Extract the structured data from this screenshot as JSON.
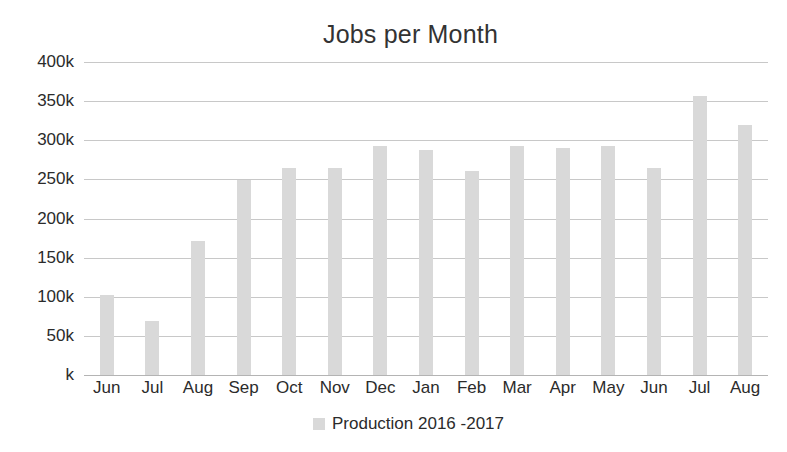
{
  "chart_data": {
    "type": "bar",
    "title": "Jobs per Month",
    "xlabel": "",
    "ylabel": "",
    "categories": [
      "Jun",
      "Jul",
      "Aug",
      "Sep",
      "Oct",
      "Nov",
      "Dec",
      "Jan",
      "Feb",
      "Mar",
      "Apr",
      "May",
      "Jun",
      "Jul",
      "Aug"
    ],
    "values": [
      102000,
      69000,
      171000,
      249000,
      264000,
      265000,
      293000,
      288000,
      261000,
      293000,
      290000,
      293000,
      265000,
      357000,
      319000
    ],
    "series": [
      {
        "name": "Production 2016 -2017",
        "values": [
          102000,
          69000,
          171000,
          249000,
          264000,
          265000,
          293000,
          288000,
          261000,
          293000,
          290000,
          293000,
          265000,
          357000,
          319000
        ]
      }
    ],
    "ylim": [
      0,
      400000
    ],
    "ytick_values": [
      400000,
      350000,
      300000,
      250000,
      200000,
      150000,
      100000,
      50000,
      0
    ],
    "ytick_labels": [
      "400k",
      "350k",
      "300k",
      "250k",
      "200k",
      "150k",
      "100k",
      "50k",
      "k"
    ],
    "grid": true,
    "legend_position": "bottom",
    "legend": [
      "Production 2016 -2017"
    ],
    "bar_color": "#d9d9d9",
    "gridline_color": "#c8c8c8",
    "background_color": "#ffffff"
  },
  "legend": {
    "swatch_name": "legend-swatch",
    "label": "Production 2016 -2017"
  }
}
